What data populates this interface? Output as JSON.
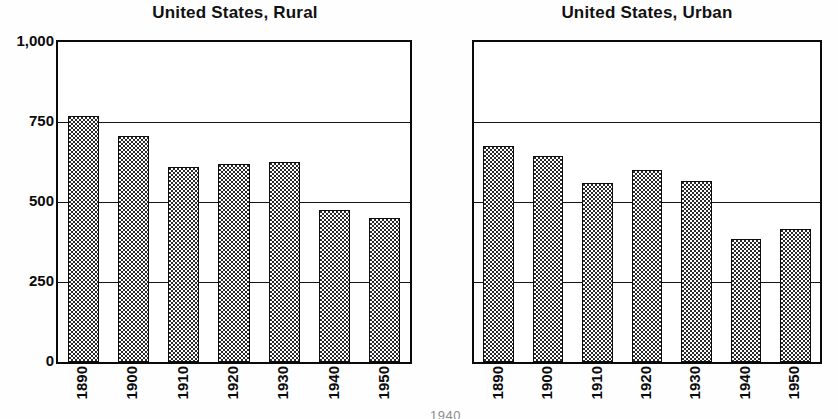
{
  "figure": {
    "background": "#ffffff",
    "ink_color": "#0a0a0a",
    "bar_fill_dot_color": "#2b2b2b",
    "clipped_footer_text": "1940"
  },
  "chart_data": [
    {
      "type": "bar",
      "title": "United States, Rural",
      "xlabel": "",
      "ylabel": "",
      "categories": [
        "1890",
        "1900",
        "1910",
        "1920",
        "1930",
        "1940",
        "1950"
      ],
      "values": [
        770,
        705,
        610,
        620,
        625,
        475,
        450
      ],
      "ylim": [
        0,
        1000
      ],
      "yticks": [
        0,
        250,
        500,
        750,
        1000
      ],
      "ytick_labels": [
        "0",
        "250",
        "500",
        "750",
        "1,000"
      ],
      "grid": true,
      "grid_axis": "y",
      "legend": "none",
      "xtick_rotation": 90
    },
    {
      "type": "bar",
      "title": "United States, Urban",
      "xlabel": "",
      "ylabel": "",
      "categories": [
        "1890",
        "1900",
        "1910",
        "1920",
        "1930",
        "1940",
        "1950"
      ],
      "values": [
        675,
        645,
        560,
        600,
        565,
        385,
        415
      ],
      "ylim": [
        0,
        1000
      ],
      "yticks": [
        0,
        250,
        500,
        750,
        1000
      ],
      "ytick_labels": [
        "",
        "",
        "",
        "",
        ""
      ],
      "grid": true,
      "grid_axis": "y",
      "legend": "none",
      "xtick_rotation": 90
    }
  ]
}
